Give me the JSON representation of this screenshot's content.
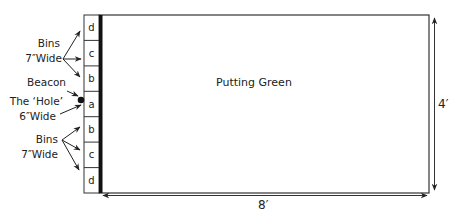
{
  "title": "Putting Green",
  "green": {
    "label": "Putting Green",
    "width_label": "8′",
    "height_label": "4′"
  },
  "bins": [
    {
      "label": "d"
    },
    {
      "label": "c"
    },
    {
      "label": "b"
    },
    {
      "label": "a"
    },
    {
      "label": "b"
    },
    {
      "label": "c"
    },
    {
      "label": "d"
    }
  ],
  "annotations": {
    "bins_top": {
      "line1": "Bins",
      "line2": "7″Wide"
    },
    "beacon": "Beacon",
    "hole": {
      "line1": "The ‘Hole’",
      "line2": "6″Wide"
    },
    "bins_bottom": {
      "line1": "Bins",
      "line2": "7″Wide"
    }
  },
  "colors": {
    "outline": "#333333",
    "bar": "#111111",
    "background": "#ffffff"
  }
}
